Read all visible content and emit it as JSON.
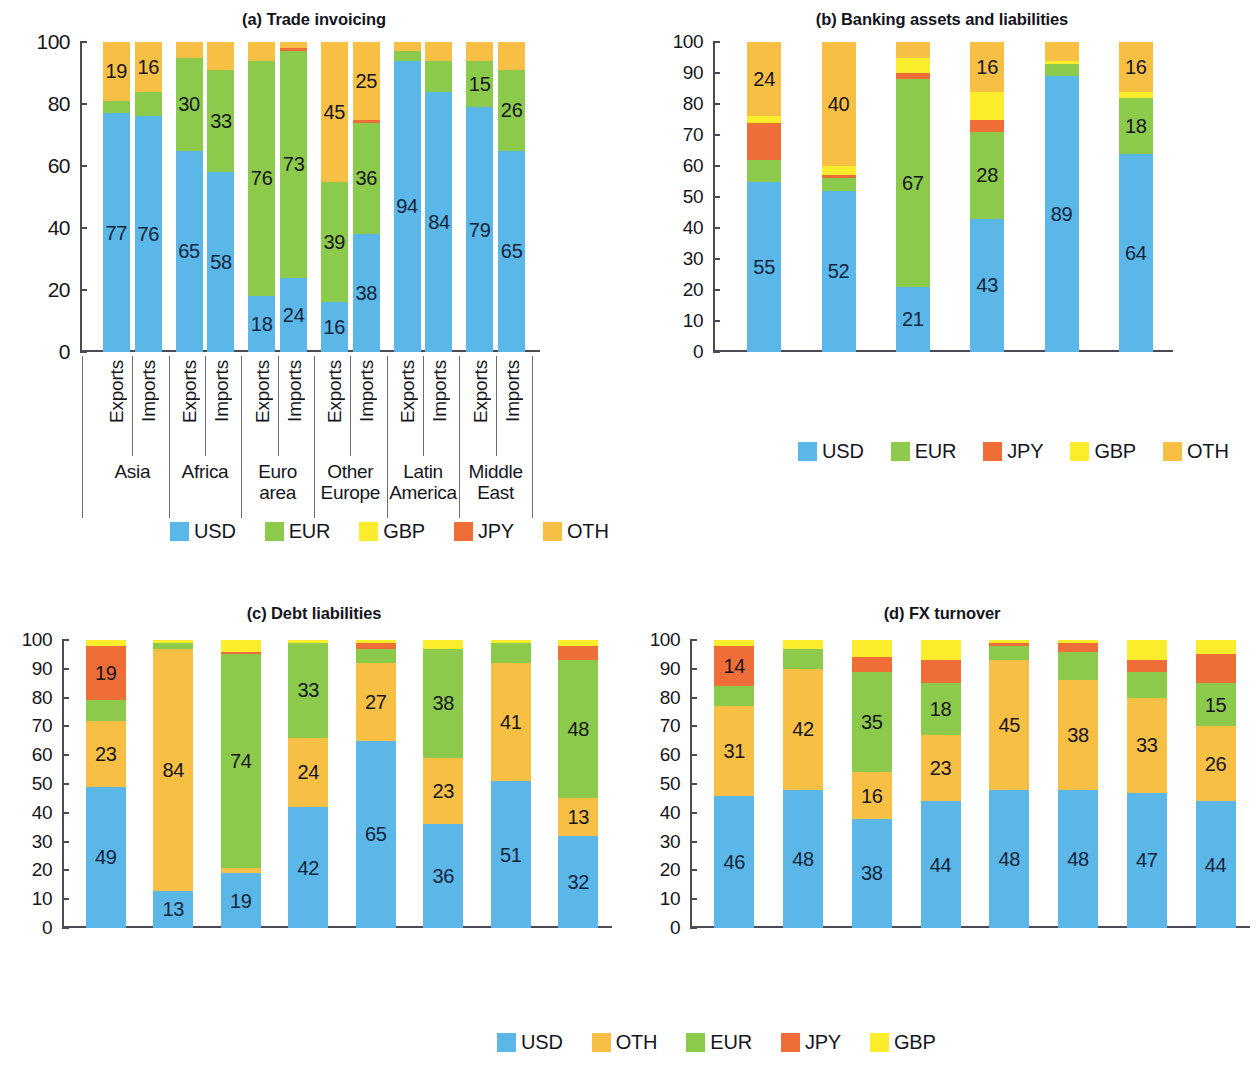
{
  "colors": {
    "USD": "#5bb7e8",
    "EUR": "#8cca4b",
    "GBP": "#fbed2c",
    "JPY": "#ef6e38",
    "OTH": "#f8bf45"
  },
  "panels": {
    "a": {
      "title": "(a) Trade invoicing",
      "yticks": [
        "0",
        "20",
        "40",
        "60",
        "80",
        "100"
      ],
      "legend": [
        "USD",
        "EUR",
        "GBP",
        "JPY",
        "OTH"
      ]
    },
    "b": {
      "title": "(b) Banking assets and liabilities",
      "yticks": [
        "0",
        "10",
        "20",
        "30",
        "40",
        "50",
        "60",
        "70",
        "80",
        "90",
        "100"
      ],
      "legend": [
        "USD",
        "EUR",
        "JPY",
        "GBP",
        "OTH"
      ]
    },
    "c": {
      "title": "(c) Debt liabilities",
      "yticks": [
        "0",
        "10",
        "20",
        "30",
        "40",
        "50",
        "60",
        "70",
        "80",
        "90",
        "100"
      ],
      "legend": [
        "USD",
        "OTH",
        "EUR",
        "JPY",
        "GBP"
      ]
    },
    "d": {
      "title": "(d) FX turnover",
      "yticks": [
        "0",
        "10",
        "20",
        "30",
        "40",
        "50",
        "60",
        "70",
        "80",
        "90",
        "100"
      ],
      "legend": [
        "USD",
        "OTH",
        "EUR",
        "JPY",
        "GBP"
      ]
    }
  },
  "chart_data": [
    {
      "type": "bar",
      "id": "a",
      "title": "(a) Trade invoicing",
      "stacked": true,
      "ylim": [
        0,
        100
      ],
      "yticks": [
        0,
        20,
        40,
        60,
        80,
        100
      ],
      "ylabel": "",
      "xlabel": "",
      "grid": false,
      "legend_position": "bottom",
      "groups": [
        "Asia",
        "Africa",
        "Euro area",
        "Other Europe",
        "Latin America",
        "Middle East"
      ],
      "subcategories": [
        "Exports",
        "Imports"
      ],
      "categories": [
        "Asia Exports",
        "Asia Imports",
        "Africa Exports",
        "Africa Imports",
        "Euro area Exports",
        "Euro area Imports",
        "Other Europe Exports",
        "Other Europe Imports",
        "Latin America Exports",
        "Latin America Imports",
        "Middle East Exports",
        "Middle East Imports"
      ],
      "stack_order": [
        "USD",
        "EUR",
        "GBP",
        "JPY",
        "OTH"
      ],
      "series": [
        {
          "name": "USD",
          "values": [
            77,
            76,
            65,
            58,
            18,
            24,
            16,
            38,
            94,
            84,
            79,
            65
          ]
        },
        {
          "name": "EUR",
          "values": [
            4,
            8,
            30,
            33,
            76,
            73,
            39,
            36,
            3,
            10,
            15,
            26
          ]
        },
        {
          "name": "GBP",
          "values": [
            0,
            0,
            0,
            0,
            0,
            0,
            0,
            0,
            0,
            0,
            0,
            0
          ]
        },
        {
          "name": "JPY",
          "values": [
            0,
            0,
            0,
            0,
            0,
            1,
            0,
            1,
            0,
            0,
            0,
            0
          ]
        },
        {
          "name": "OTH",
          "values": [
            19,
            16,
            5,
            9,
            6,
            2,
            45,
            25,
            3,
            6,
            6,
            9
          ]
        }
      ],
      "labeled_values": {
        "USD": [
          77,
          76,
          65,
          58,
          18,
          24,
          16,
          38,
          94,
          84,
          79,
          65
        ],
        "EUR": [
          null,
          null,
          30,
          33,
          76,
          73,
          39,
          36,
          null,
          null,
          15,
          26
        ],
        "OTH": [
          19,
          16,
          null,
          null,
          null,
          null,
          45,
          25,
          null,
          null,
          null,
          null
        ]
      }
    },
    {
      "type": "bar",
      "id": "b",
      "title": "(b) Banking assets and liabilities",
      "stacked": true,
      "ylim": [
        0,
        100
      ],
      "yticks": [
        0,
        10,
        20,
        30,
        40,
        50,
        60,
        70,
        80,
        90,
        100
      ],
      "ylabel": "",
      "xlabel": "",
      "grid": false,
      "legend_position": "bottom",
      "categories": [
        "Asia",
        "Africa",
        "Euro area",
        "Other Europe",
        "Latin America",
        "Middle East"
      ],
      "stack_order": [
        "USD",
        "EUR",
        "JPY",
        "GBP",
        "OTH"
      ],
      "series": [
        {
          "name": "USD",
          "values": [
            55,
            52,
            21,
            43,
            89,
            64
          ]
        },
        {
          "name": "EUR",
          "values": [
            7,
            4,
            67,
            28,
            4,
            18
          ]
        },
        {
          "name": "JPY",
          "values": [
            12,
            1,
            2,
            4,
            0,
            0
          ]
        },
        {
          "name": "GBP",
          "values": [
            2,
            3,
            5,
            9,
            1,
            2
          ]
        },
        {
          "name": "OTH",
          "values": [
            24,
            40,
            5,
            16,
            6,
            16
          ]
        }
      ],
      "labeled_values": {
        "USD": [
          55,
          52,
          21,
          43,
          89,
          64
        ],
        "EUR": [
          null,
          null,
          67,
          28,
          null,
          18
        ],
        "OTH": [
          24,
          40,
          null,
          16,
          null,
          16
        ]
      }
    },
    {
      "type": "bar",
      "id": "c",
      "title": "(c) Debt liabilities",
      "stacked": true,
      "ylim": [
        0,
        100
      ],
      "yticks": [
        0,
        10,
        20,
        30,
        40,
        50,
        60,
        70,
        80,
        90,
        100
      ],
      "ylabel": "",
      "xlabel": "",
      "grid": false,
      "legend_position": "bottom",
      "categories": [
        "Asia",
        "Africa",
        "Euro area",
        "Other Europe",
        "Latin America",
        "Middle East",
        "North America",
        "World"
      ],
      "stack_order": [
        "USD",
        "OTH",
        "EUR",
        "JPY",
        "GBP"
      ],
      "series": [
        {
          "name": "USD",
          "values": [
            49,
            13,
            19,
            42,
            65,
            36,
            51,
            32
          ]
        },
        {
          "name": "OTH",
          "values": [
            23,
            84,
            2,
            24,
            27,
            23,
            41,
            13
          ]
        },
        {
          "name": "EUR",
          "values": [
            7,
            2,
            74,
            33,
            5,
            38,
            7,
            48
          ]
        },
        {
          "name": "JPY",
          "values": [
            19,
            0,
            1,
            0,
            2,
            0,
            0,
            5
          ]
        },
        {
          "name": "GBP",
          "values": [
            2,
            1,
            4,
            1,
            1,
            3,
            1,
            2
          ]
        }
      ],
      "labeled_values": {
        "USD": [
          49,
          13,
          19,
          42,
          65,
          36,
          51,
          32
        ],
        "OTH": [
          23,
          84,
          null,
          24,
          27,
          23,
          41,
          13
        ],
        "EUR": [
          null,
          null,
          74,
          33,
          null,
          38,
          null,
          48
        ],
        "JPY": [
          19,
          null,
          null,
          null,
          null,
          null,
          null,
          null
        ]
      }
    },
    {
      "type": "bar",
      "id": "d",
      "title": "(d) FX turnover",
      "stacked": true,
      "ylim": [
        0,
        100
      ],
      "yticks": [
        0,
        10,
        20,
        30,
        40,
        50,
        60,
        70,
        80,
        90,
        100
      ],
      "ylabel": "",
      "xlabel": "",
      "grid": false,
      "legend_position": "bottom",
      "categories": [
        "Asia",
        "Africa",
        "Euro area",
        "Other Europe",
        "Latin America",
        "Middle East",
        "North America",
        "World"
      ],
      "stack_order": [
        "USD",
        "OTH",
        "EUR",
        "JPY",
        "GBP"
      ],
      "series": [
        {
          "name": "USD",
          "values": [
            46,
            48,
            38,
            44,
            48,
            48,
            47,
            44
          ]
        },
        {
          "name": "OTH",
          "values": [
            31,
            42,
            16,
            23,
            45,
            38,
            33,
            26
          ]
        },
        {
          "name": "EUR",
          "values": [
            7,
            7,
            35,
            18,
            5,
            10,
            9,
            15
          ]
        },
        {
          "name": "JPY",
          "values": [
            14,
            0,
            5,
            8,
            1,
            3,
            4,
            10
          ]
        },
        {
          "name": "GBP",
          "values": [
            2,
            3,
            6,
            7,
            1,
            1,
            7,
            5
          ]
        }
      ],
      "labeled_values": {
        "USD": [
          46,
          48,
          38,
          44,
          48,
          48,
          47,
          44
        ],
        "OTH": [
          31,
          42,
          16,
          23,
          45,
          38,
          33,
          26
        ],
        "EUR": [
          null,
          null,
          35,
          18,
          null,
          null,
          null,
          15
        ],
        "JPY": [
          14,
          null,
          null,
          null,
          null,
          null,
          null,
          null
        ]
      }
    }
  ]
}
